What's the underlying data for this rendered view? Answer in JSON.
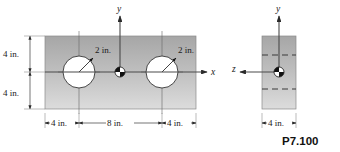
{
  "figure": {
    "label": "P7.100",
    "background_color": "#ffffff",
    "plate_fill_top": "#a8a8a8",
    "plate_fill_bottom": "#d8d8d8",
    "hole_fill": "#ffffff",
    "line_color": "#3a3a3a"
  },
  "front_view": {
    "name": "front-view",
    "axes": {
      "y_label": "y",
      "x_label": "x",
      "origin_marker": "centroid-marker"
    },
    "vertical_dimensions": [
      {
        "value": "4 in.",
        "position": "upper"
      },
      {
        "value": "4 in.",
        "position": "lower"
      }
    ],
    "horizontal_dimensions": [
      {
        "value": "4 in.",
        "position": "left-edge-to-hole"
      },
      {
        "value": "8 in.",
        "position": "hole-to-hole"
      },
      {
        "value": "4 in.",
        "position": "hole-to-right-edge"
      }
    ],
    "holes": [
      {
        "name": "left-hole",
        "radius_label": "2 in."
      },
      {
        "name": "right-hole",
        "radius_label": "2 in."
      }
    ]
  },
  "side_view": {
    "name": "side-view",
    "axes": {
      "y_label": "y",
      "z_label": "z",
      "origin_marker": "centroid-marker"
    },
    "horizontal_dimensions": [
      {
        "value": "4 in.",
        "position": "thickness"
      }
    ],
    "hidden_lines": 2
  }
}
